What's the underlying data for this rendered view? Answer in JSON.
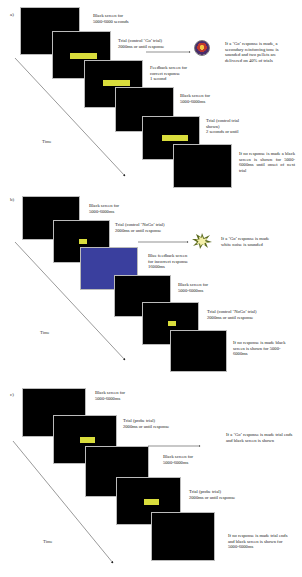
{
  "panels": [
    {
      "label": "a)",
      "time_label": "Time",
      "captions": {
        "c1": [
          "Black screen for",
          "5000-6000 seconds"
        ],
        "c2": [
          "Trial (control ‘Go’ trial)",
          "2000ms or until response"
        ],
        "c3": [
          "Feedback screen for",
          "correct response",
          "1 second"
        ],
        "c4": [
          "Black screen for",
          "5000-6000ms"
        ],
        "c5": [
          "Trial (control trial",
          "shown)",
          "2 seconds or until"
        ],
        "c6": "If no response is made a black screen is shown for 5000-6000ms until onset of next trial",
        "outcome": "If a ‘Go’ response is made, a secondary reinforcing tone is sounded and two pellets are delivered on 40% of trials"
      },
      "icon": "reinforcer-tone-icon"
    },
    {
      "label": "b)",
      "time_label": "Time",
      "captions": {
        "c1": [
          "Black screen for",
          "5000-6000ms"
        ],
        "c2": [
          "Trial (control ‘NoGo’ trial)",
          "2000ms or until response"
        ],
        "c3": [
          "Blue feedback screen",
          "for incorrect response",
          "16000ms"
        ],
        "c4": [
          "Black screen for",
          "5000-6000ms"
        ],
        "c5": [
          "Trial (control ‘NoGo’ trial)",
          "2000ms or until response"
        ],
        "c6": "If no response is made black screen is shown for 5000-6000ms",
        "outcome": [
          "If a ‘Go’ response is made",
          "white noise is sounded"
        ]
      },
      "icon": "white-noise-burst-icon",
      "colors": {
        "feedback_screen": "#3a3f9e"
      }
    },
    {
      "label": "c)",
      "time_label": "Time",
      "captions": {
        "c1": [
          "Black screen for",
          "5000-6000ms"
        ],
        "c2": [
          "Trial (probe trial)",
          "2000ms or until response"
        ],
        "c3": [
          "Black screen for",
          "5000-6000ms"
        ],
        "c4": [
          "Trial (probe trial)",
          "2000ms or until response"
        ],
        "c5": "If no response is made trial ends and black screen is shown for 5000-6000ms",
        "outcome": "If a ‘Go’ response is made trial ends and black screen is shown"
      }
    }
  ],
  "colors": {
    "screen": "#000000",
    "stimulus": "#d9dd3c",
    "blue_feedback": "#3a3f9e"
  }
}
